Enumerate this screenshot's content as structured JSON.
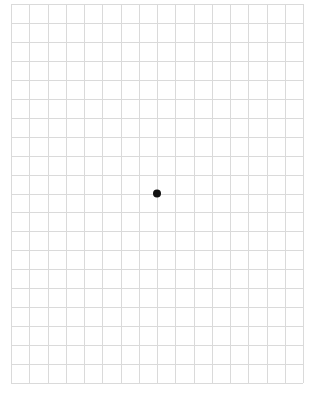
{
  "grid": {
    "columns": 16,
    "rows": 20,
    "origin_x": 11,
    "origin_y": 4,
    "width": 292,
    "height": 379,
    "line_color": "#dadada",
    "background": "#ffffff"
  },
  "marker": {
    "column": 8,
    "row": 10,
    "radius": 4,
    "color": "#111111"
  }
}
